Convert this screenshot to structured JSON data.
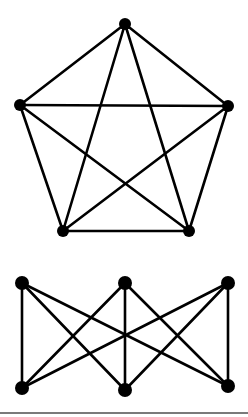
{
  "diagram": {
    "title": "",
    "colors": {
      "background": "#ffffff",
      "edge": "#000000",
      "node": "#000000",
      "border": "#7a7a7a"
    },
    "graphs": [
      {
        "name": "K5",
        "type": "complete-graph",
        "node_radius": 6,
        "nodes": [
          {
            "id": "a",
            "x": 125,
            "y": 24
          },
          {
            "id": "b",
            "x": 20,
            "y": 105
          },
          {
            "id": "c",
            "x": 228,
            "y": 106
          },
          {
            "id": "d",
            "x": 63,
            "y": 231
          },
          {
            "id": "e",
            "x": 189,
            "y": 231
          }
        ],
        "edges": [
          [
            "a",
            "b"
          ],
          [
            "a",
            "c"
          ],
          [
            "a",
            "d"
          ],
          [
            "a",
            "e"
          ],
          [
            "b",
            "c"
          ],
          [
            "b",
            "d"
          ],
          [
            "b",
            "e"
          ],
          [
            "c",
            "d"
          ],
          [
            "c",
            "e"
          ],
          [
            "d",
            "e"
          ]
        ]
      },
      {
        "name": "K3,3",
        "type": "complete-bipartite-graph",
        "node_radius": 7,
        "nodes": [
          {
            "id": "u1",
            "x": 22,
            "y": 283
          },
          {
            "id": "u2",
            "x": 125,
            "y": 283
          },
          {
            "id": "u3",
            "x": 228,
            "y": 283
          },
          {
            "id": "v1",
            "x": 22,
            "y": 388
          },
          {
            "id": "v2",
            "x": 125,
            "y": 390
          },
          {
            "id": "v3",
            "x": 228,
            "y": 386
          }
        ],
        "edges": [
          [
            "u1",
            "v1"
          ],
          [
            "u1",
            "v2"
          ],
          [
            "u1",
            "v3"
          ],
          [
            "u2",
            "v1"
          ],
          [
            "u2",
            "v2"
          ],
          [
            "u2",
            "v3"
          ],
          [
            "u3",
            "v1"
          ],
          [
            "u3",
            "v2"
          ],
          [
            "u3",
            "v3"
          ]
        ]
      }
    ]
  }
}
